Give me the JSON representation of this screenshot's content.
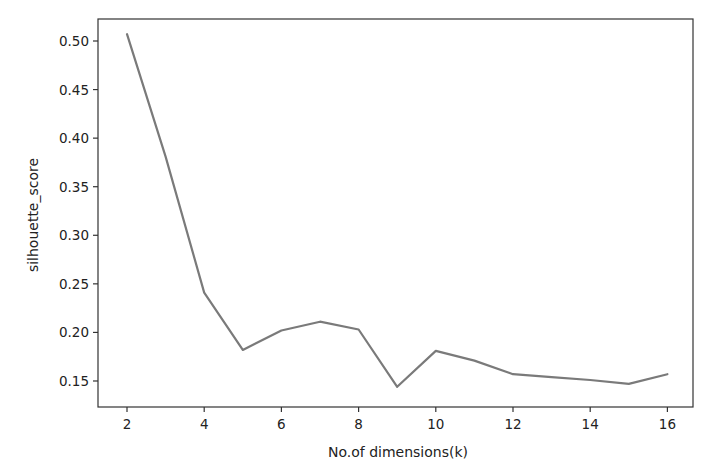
{
  "chart_data": {
    "type": "line",
    "title": "",
    "xlabel": "No.of dimensions(k)",
    "ylabel": "silhouette_score",
    "x": [
      2,
      3,
      4,
      5,
      6,
      7,
      8,
      9,
      10,
      11,
      12,
      13,
      14,
      15,
      16
    ],
    "series": [
      {
        "name": "silhouette_score",
        "values": [
          0.507,
          0.381,
          0.241,
          0.182,
          0.202,
          0.211,
          0.203,
          0.144,
          0.181,
          0.171,
          0.157,
          0.154,
          0.151,
          0.147,
          0.157
        ],
        "color": "#7a7a7a"
      }
    ],
    "xticks": [
      2,
      4,
      6,
      8,
      10,
      12,
      14,
      16
    ],
    "yticks": [
      0.15,
      0.2,
      0.25,
      0.3,
      0.35,
      0.4,
      0.45,
      0.5
    ],
    "ytick_labels": [
      "0.15",
      "0.20",
      "0.25",
      "0.30",
      "0.35",
      "0.40",
      "0.45",
      "0.50"
    ],
    "xlim": [
      1.3,
      16.7
    ],
    "ylim": [
      0.123,
      0.523
    ],
    "grid": false,
    "legend": null
  }
}
